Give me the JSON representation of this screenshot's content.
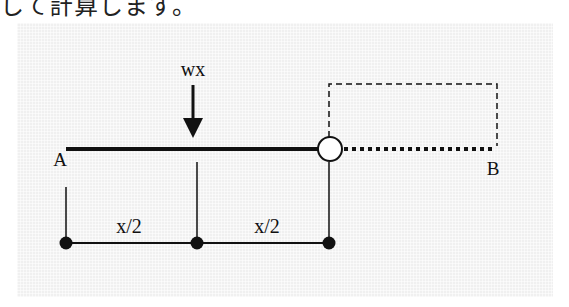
{
  "caption": "して計算します。",
  "diagram": {
    "load_label": "wx",
    "point_a": "A",
    "point_b": "B",
    "dim_left": "x/2",
    "dim_right": "x/2"
  },
  "colors": {
    "background": "#f0f0f0",
    "ink": "#111111"
  }
}
